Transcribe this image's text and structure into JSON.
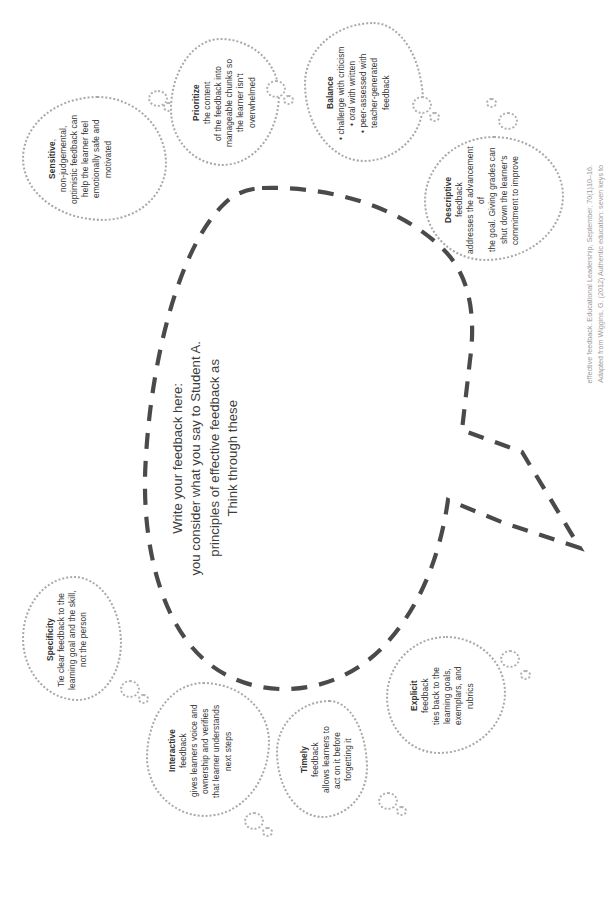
{
  "page": {
    "orientation": "rotated-90",
    "background_color": "#ffffff",
    "bubble_outline_color": "#a8a8a8",
    "speech_outline_color": "#4a4a4a",
    "text_color": "#3a3a3a",
    "attribution_color": "#9a9a9a"
  },
  "centre_prompt": {
    "lines": [
      "Think through these",
      "principles of effective feedback as",
      "you consider what you say to Student A.",
      "Write your feedback here:"
    ]
  },
  "bubbles": [
    {
      "id": "sensitive",
      "title": "Sensitive",
      "body": "non-judgemental,\noptimistic feedback can\nhelp the learner feel\nemotionally safe and\nmotivated",
      "title_separator": ","
    },
    {
      "id": "prioritize",
      "title": "Prioritize",
      "body": "the content\nof the feedback into\nmanageable chunks so\nthe learner isn't\noverwhelmed",
      "title_separator": " "
    },
    {
      "id": "balance",
      "title": "Balance",
      "body": "• challenge with criticism\n• oral with written\n• peer-assessed with\nteacher-generated\nfeedback",
      "title_separator": ""
    },
    {
      "id": "descriptive",
      "title": "Descriptive",
      "body": "feedback\naddresses the advancement of\nthe goal. Giving grades can\nshut down the learner's\ncommitment to improve",
      "title_separator": " "
    },
    {
      "id": "specificity",
      "title": "Specificity",
      "body": "Tie clear feedback to the\nlearning goal and the skill,\nnot the person",
      "title_separator": ""
    },
    {
      "id": "interactive",
      "title": "Interactive",
      "body": "feedback\ngives learners voice and\nownership and verifies\nthat learner understands\nnext steps",
      "title_separator": " "
    },
    {
      "id": "timely",
      "title": "Timely",
      "body": "feedback\nallows learners to\nact on it before\nforgetting it",
      "title_separator": " "
    },
    {
      "id": "explicit",
      "title": "Explicit",
      "body": "feedback\nties back to the\nlearning goals,\nexemplars, and\nrubrics",
      "title_separator": " "
    }
  ],
  "attribution": {
    "line1": "Adapted from Wiggins, G. (2012) Authentic education: seven keys to",
    "line2_plain_a": "effective feedback. ",
    "line2_italic": "Educational Leadership",
    "line2_plain_b": ", September, 70(1)10–16."
  }
}
